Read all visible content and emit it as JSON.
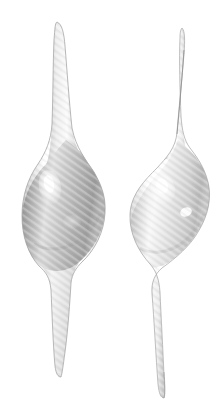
{
  "image": {
    "kind": "3d-rendered-shapes",
    "subject": "two fusiform spindle-shaped objects",
    "width": 224,
    "height": 418,
    "background_color": "#ffffff"
  },
  "palette": {
    "background": "#ffffff",
    "left_body_base": "#b4b4b4",
    "left_body_shadow": "#8e8e8e",
    "left_body_light": "#e4e4e4",
    "left_highlight": "#fdfdfd",
    "right_body_base": "#dcdcdc",
    "right_body_shadow": "#b0b0b0",
    "right_body_light": "#f4f4f4",
    "right_highlight": "#ffffff",
    "outline": "#9a9a9a",
    "stripe_light": "#f0f0f0",
    "stripe_dark": "#a8a8a8"
  },
  "texture": {
    "name": "diagonal-scanline-hatching",
    "angle_deg": 35,
    "period_px": 4,
    "opacity": 0.35
  },
  "objects": [
    {
      "id": "left-spindle",
      "name": "left-spindle-object",
      "tone": "mid-gray",
      "bounds": {
        "x": 22,
        "y": 22,
        "width": 84,
        "height": 356
      },
      "bulb": {
        "cx": 63,
        "cy": 208,
        "rx": 41,
        "ry": 63
      },
      "stem": {
        "label": "upper-neck",
        "tip_x": 57,
        "tip_y": 22,
        "base_y": 150
      },
      "tail": {
        "label": "lower-tail",
        "tip_x": 61,
        "tip_y": 376,
        "base_y": 268
      },
      "highlight": {
        "cx": 50,
        "cy": 186,
        "rx": 9,
        "ry": 15,
        "intensity": "strong"
      }
    },
    {
      "id": "right-spindle",
      "name": "right-spindle-object",
      "tone": "light-gray",
      "bounds": {
        "x": 130,
        "y": 28,
        "width": 82,
        "height": 372
      },
      "bulb": {
        "cx": 170,
        "cy": 212,
        "rx": 40,
        "ry": 62
      },
      "stem": {
        "label": "upper-neck",
        "tip_x": 182,
        "tip_y": 28,
        "base_y": 154
      },
      "tail": {
        "label": "lower-tail",
        "tip_x": 164,
        "tip_y": 398,
        "base_y": 272
      },
      "highlight": {
        "cx": 163,
        "cy": 188,
        "rx": 10,
        "ry": 13,
        "intensity": "strong"
      },
      "secondary_highlight": {
        "cx": 186,
        "cy": 212,
        "rx": 5,
        "ry": 4,
        "intensity": "soft"
      }
    }
  ],
  "labels": {
    "title": "",
    "caption": "",
    "annotations": []
  }
}
